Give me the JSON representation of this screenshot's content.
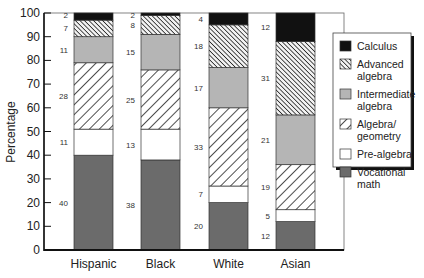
{
  "chart_data": {
    "type": "bar",
    "stacked": true,
    "title": "",
    "xlabel": "",
    "ylabel": "Percentage",
    "ylim": [
      0,
      100
    ],
    "yticks": [
      0,
      10,
      20,
      30,
      40,
      50,
      60,
      70,
      80,
      90,
      100
    ],
    "grid": false,
    "legend_position": "right",
    "categories": [
      "Hispanic",
      "Black",
      "White",
      "Asian"
    ],
    "series": [
      {
        "name": "Vocational math",
        "legend_lines": [
          "Vocational",
          "math"
        ],
        "pattern": "solid-dark",
        "color": "#6b6b6b",
        "values": [
          40,
          38,
          20,
          12
        ]
      },
      {
        "name": "Pre-algebra",
        "legend_lines": [
          "Pre-algebra"
        ],
        "pattern": "solid-white",
        "color": "#ffffff",
        "values": [
          11,
          13,
          7,
          5
        ]
      },
      {
        "name": "Algebra/geometry",
        "legend_lines": [
          "Algebra/",
          "geometry"
        ],
        "pattern": "wide-diagonal-hatch",
        "color": "#ffffff",
        "values": [
          28,
          25,
          33,
          19
        ]
      },
      {
        "name": "Intermediate algebra",
        "legend_lines": [
          "Intermediate",
          "algebra"
        ],
        "pattern": "solid-light-gray",
        "color": "#b5b5b5",
        "values": [
          11,
          15,
          17,
          21
        ]
      },
      {
        "name": "Advanced algebra",
        "legend_lines": [
          "Advanced",
          "algebra"
        ],
        "pattern": "dense-reverse-hatch",
        "color": "#555555",
        "values": [
          7,
          8,
          18,
          31
        ]
      },
      {
        "name": "Calculus",
        "legend_lines": [
          "Calculus"
        ],
        "pattern": "solid-black",
        "color": "#111111",
        "values": [
          2,
          2,
          4,
          12
        ]
      }
    ],
    "legend_order": [
      "Calculus",
      "Advanced algebra",
      "Intermediate algebra",
      "Algebra/geometry",
      "Pre-algebra",
      "Vocational math"
    ]
  }
}
